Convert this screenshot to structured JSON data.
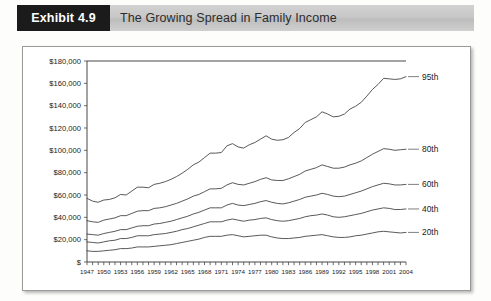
{
  "header": {
    "exhibit_tag": "Exhibit 4.9",
    "title": "The Growing Spread in Family Income"
  },
  "chart_data": {
    "type": "line",
    "title": "The Growing Spread in Family Income",
    "xlabel": "",
    "ylabel": "",
    "grid": false,
    "legend_position": "right-inline",
    "xlim": [
      1947,
      2004
    ],
    "ylim": [
      0,
      180000
    ],
    "ytick_labels": [
      "$",
      "$20,000",
      "$40,000",
      "$60,000",
      "$80,000",
      "$100,000",
      "$120,000",
      "$140,000",
      "$160,000",
      "$180,000"
    ],
    "ytick_values": [
      0,
      20000,
      40000,
      60000,
      80000,
      100000,
      120000,
      140000,
      160000,
      180000
    ],
    "xtick_labels": [
      "1947",
      "1950",
      "1953",
      "1956",
      "1959",
      "1962",
      "1965",
      "1968",
      "1971",
      "1974",
      "1977",
      "1980",
      "1983",
      "1986",
      "1989",
      "1992",
      "1995",
      "1998",
      "2001",
      "2004"
    ],
    "xtick_values": [
      1947,
      1950,
      1953,
      1956,
      1959,
      1962,
      1965,
      1968,
      1971,
      1974,
      1977,
      1980,
      1983,
      1986,
      1989,
      1992,
      1995,
      1998,
      2001,
      2004
    ],
    "x": [
      1947,
      1948,
      1949,
      1950,
      1951,
      1952,
      1953,
      1954,
      1955,
      1956,
      1957,
      1958,
      1959,
      1960,
      1961,
      1962,
      1963,
      1964,
      1965,
      1966,
      1967,
      1968,
      1969,
      1970,
      1971,
      1972,
      1973,
      1974,
      1975,
      1976,
      1977,
      1978,
      1979,
      1980,
      1981,
      1982,
      1983,
      1984,
      1985,
      1986,
      1987,
      1988,
      1989,
      1990,
      1991,
      1992,
      1993,
      1994,
      1995,
      1996,
      1997,
      1998,
      1999,
      2000,
      2001,
      2002,
      2003,
      2004
    ],
    "series": [
      {
        "name": "95th",
        "label": "95th",
        "values": [
          57000,
          54500,
          53500,
          55500,
          56000,
          57500,
          60500,
          60000,
          63500,
          67000,
          67000,
          66500,
          69500,
          70500,
          72000,
          74000,
          76500,
          79500,
          83000,
          87000,
          89500,
          93500,
          97500,
          97500,
          98000,
          104000,
          106000,
          103000,
          102000,
          105000,
          107000,
          110000,
          113000,
          110000,
          109000,
          109500,
          111500,
          116000,
          119500,
          125000,
          127500,
          130000,
          134500,
          132500,
          130000,
          130500,
          132500,
          137000,
          139500,
          143000,
          148500,
          154500,
          159000,
          164500,
          164000,
          163500,
          164000,
          166000
        ]
      },
      {
        "name": "80th",
        "label": "80th",
        "values": [
          37000,
          36000,
          35500,
          37500,
          38500,
          39500,
          41500,
          41500,
          43500,
          45500,
          46000,
          46000,
          48000,
          48500,
          49500,
          51000,
          52500,
          54500,
          56500,
          59000,
          60500,
          63000,
          65500,
          65500,
          66000,
          69000,
          71000,
          69500,
          69000,
          70500,
          72000,
          74000,
          75500,
          73500,
          73000,
          73000,
          74500,
          76500,
          78500,
          81500,
          83000,
          84500,
          87000,
          85500,
          84000,
          84000,
          85000,
          87000,
          88500,
          90500,
          93500,
          96500,
          99000,
          101500,
          101000,
          100000,
          100500,
          101000
        ]
      },
      {
        "name": "60th",
        "label": "60th",
        "values": [
          25000,
          24500,
          24000,
          25500,
          26500,
          27500,
          29000,
          29000,
          30500,
          32000,
          32500,
          32500,
          34000,
          34500,
          35500,
          36500,
          38000,
          39500,
          41000,
          43000,
          44500,
          46500,
          48500,
          48500,
          48500,
          51000,
          52500,
          51000,
          50500,
          51500,
          52500,
          54000,
          55000,
          53500,
          52500,
          52000,
          53000,
          54500,
          56000,
          58000,
          59000,
          60000,
          61500,
          60500,
          59000,
          58500,
          59000,
          60500,
          62000,
          63500,
          65500,
          67500,
          69000,
          70500,
          70000,
          69000,
          69000,
          69500
        ]
      },
      {
        "name": "40th",
        "label": "40th",
        "values": [
          18000,
          17500,
          17000,
          18000,
          19000,
          19500,
          21000,
          21000,
          22000,
          23500,
          23500,
          23500,
          24500,
          25000,
          25500,
          26500,
          27500,
          29000,
          30000,
          31500,
          33000,
          34500,
          36000,
          36000,
          36000,
          37500,
          38500,
          37500,
          36500,
          37500,
          38000,
          39000,
          39500,
          38000,
          37000,
          36500,
          37000,
          38000,
          39000,
          40500,
          41500,
          42000,
          43000,
          42000,
          40500,
          40000,
          40500,
          41500,
          42500,
          43500,
          45000,
          46500,
          47500,
          48500,
          48000,
          47000,
          47000,
          47500
        ]
      },
      {
        "name": "20th",
        "label": "20th",
        "values": [
          10000,
          9500,
          9500,
          10000,
          10500,
          11000,
          12000,
          12000,
          12500,
          13500,
          13500,
          13500,
          14000,
          14500,
          15000,
          15500,
          16500,
          17500,
          18500,
          19500,
          20500,
          22000,
          23000,
          23000,
          23000,
          24000,
          24500,
          23500,
          22500,
          23000,
          23500,
          24000,
          24000,
          22500,
          21500,
          21000,
          21000,
          21500,
          22000,
          23000,
          23500,
          24000,
          24500,
          23500,
          22500,
          22000,
          22000,
          22500,
          23500,
          24000,
          25000,
          26000,
          27000,
          27500,
          27000,
          26500,
          26000,
          26500
        ]
      }
    ]
  }
}
